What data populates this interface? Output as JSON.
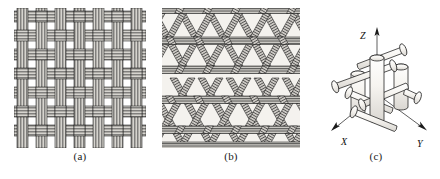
{
  "figure": {
    "type": "technical-illustration",
    "background_color": "#ffffff",
    "line_color": "#1a1a1a",
    "fill_light": "#d8d6d2",
    "fill_mid": "#b9b6b1",
    "fill_dark": "#8f8c87"
  },
  "panels": [
    {
      "id": "a",
      "caption": "(a)",
      "weave_name": "plain-weave-biaxial",
      "description": "Orthogonal two-directional plain woven fabric with flat multifilament tows crossing over and under",
      "tow_count_horizontal": 7,
      "tow_count_vertical": 7,
      "tow_filaments": 5,
      "fill": "#cfcdc8"
    },
    {
      "id": "b",
      "caption": "(b)",
      "weave_name": "triaxial-weave",
      "description": "Three-directional triaxial woven fabric forming hexagonal open cells",
      "directions": 3,
      "direction_angles_deg": [
        0,
        60,
        120
      ],
      "cell_shape": "hexagon",
      "fill": "#c6c3be"
    },
    {
      "id": "c",
      "caption": "(c)",
      "weave_name": "three-dimensional-orthogonal",
      "description": "Three-dimensional orthogonal fibre architecture of cylindrical tows along the X, Y and Z directions",
      "fill": "#f2f0ec"
    }
  ],
  "axes": {
    "z": {
      "label": "Z",
      "direction": "up"
    },
    "x": {
      "label": "X",
      "direction": "down-left"
    },
    "y": {
      "label": "Y",
      "direction": "down-right"
    }
  }
}
